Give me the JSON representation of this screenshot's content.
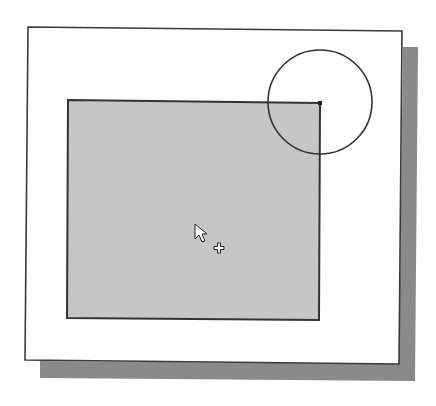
{
  "figure": {
    "colors": {
      "background": "#ffffff",
      "frame_fill": "#ffffff",
      "frame_stroke": "#3a3a3a",
      "shadow": "#8a8a8a",
      "rectangle_fill": "#c6c6c6",
      "rectangle_stroke": "#333333",
      "circle_stroke": "#333333"
    },
    "frame": {
      "points": "28,27 402,31 399,364 25,360"
    },
    "shadow": {
      "points": "403,47 418,47 415,381 40,378 40,361 399,364"
    },
    "rectangle": {
      "points": "68,100 320,103 319,320 67,318"
    },
    "circle": {
      "cx": 320,
      "cy": 102,
      "r": 52
    },
    "corner_point": {
      "cx": 320,
      "cy": 103
    },
    "cursor": {
      "type": "arrow-with-plus",
      "x": 195,
      "y": 224
    }
  }
}
